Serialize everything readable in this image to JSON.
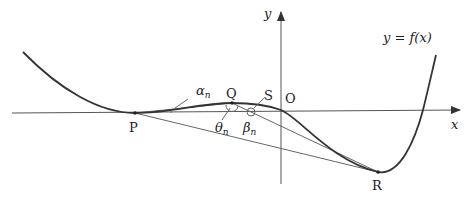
{
  "diagram": {
    "axes": {
      "x_label": "x",
      "y_label": "y",
      "origin_label": "O"
    },
    "function_label": "y = f(x)",
    "points": [
      {
        "name": "P",
        "label": "P"
      },
      {
        "name": "Q",
        "label": "Q"
      },
      {
        "name": "S",
        "label": "S"
      },
      {
        "name": "R",
        "label": "R"
      }
    ],
    "angles": [
      {
        "name": "alpha",
        "label": "α",
        "sub": "n"
      },
      {
        "name": "theta",
        "label": "θ",
        "sub": "n"
      },
      {
        "name": "beta",
        "label": "β",
        "sub": "n"
      }
    ]
  }
}
